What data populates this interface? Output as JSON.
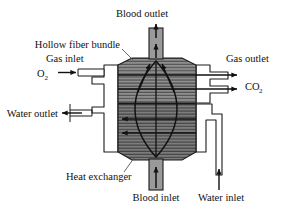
{
  "diagram": {
    "type": "schematic-cross-section",
    "colors": {
      "body_fill": "#8f8f8f",
      "body_fill_dark": "#7a7a7a",
      "hatch_line": "#4a4a4a",
      "housing_fill": "#ffffff",
      "outline": "#1a1a1a",
      "text": "#111111",
      "background": "#ffffff"
    },
    "labels": {
      "blood_outlet": "Blood outlet",
      "hollow_fiber_bundle": "Hollow fiber bundle",
      "gas_inlet": "Gas inlet",
      "gas_outlet": "Gas outlet",
      "o2": "O",
      "o2_sub": "2",
      "co2": "CO",
      "co2_sub": "2",
      "water_outlet": "Water outlet",
      "heat_exchanger": "Heat exchanger",
      "blood_inlet": "Blood inlet",
      "water_inlet": "Water inlet"
    },
    "flows": [
      {
        "name": "blood-outlet-flow",
        "direction": "up",
        "port": "top-center"
      },
      {
        "name": "blood-inlet-flow",
        "direction": "up",
        "port": "bottom-center"
      },
      {
        "name": "gas-inlet-flow",
        "direction": "right",
        "port": "left-upper"
      },
      {
        "name": "gas-outlet-flow",
        "direction": "right",
        "port": "right-upper"
      },
      {
        "name": "water-outlet-flow",
        "direction": "left",
        "port": "left-lower"
      },
      {
        "name": "water-inlet-flow",
        "direction": "up",
        "port": "bottom-right"
      }
    ]
  }
}
